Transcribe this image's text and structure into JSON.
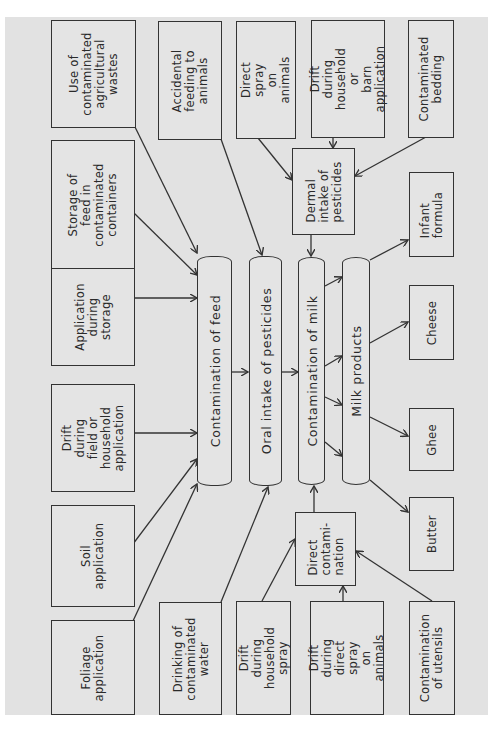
{
  "diagram": {
    "sources_feed": [
      {
        "id": "foliage",
        "label": "Foliage\napplication"
      },
      {
        "id": "soil",
        "label": "Soil\napplication"
      },
      {
        "id": "drift_field",
        "label": "Drift during\nfield or\nhousehold\napplication"
      },
      {
        "id": "app_storage",
        "label": "Application\nduring\nstorage"
      },
      {
        "id": "storage_containers",
        "label": "Storage of\nfeed in\ncontaminated\ncontainers"
      },
      {
        "id": "agri_wastes",
        "label": "Use of\ncontaminated\nagricultural\nwastes"
      }
    ],
    "sources_oral": [
      {
        "id": "drinking_water",
        "label": "Drinking of\ncontaminated\nwater"
      },
      {
        "id": "accidental_feeding",
        "label": "Accidental\nfeeding to\nanimals"
      }
    ],
    "sources_dermal": [
      {
        "id": "direct_spray",
        "label": "Direct\nspray on\nanimals"
      },
      {
        "id": "drift_barn",
        "label": "Drift during\nhousehold or\nbarn\napplication"
      },
      {
        "id": "bedding",
        "label": "Contaminated\nbedding"
      }
    ],
    "sources_direct": [
      {
        "id": "drift_household_spray",
        "label": "Drift during\nhousehold\nspray"
      },
      {
        "id": "drift_direct_spray",
        "label": "Drift during\ndirect spray\non animals"
      },
      {
        "id": "utensils",
        "label": "Contamination\nof utensils"
      }
    ],
    "process": {
      "contamination_feed": "Contamination of feed",
      "oral_intake": "Oral intake of pesticides",
      "contamination_milk": "Contamination of milk",
      "milk_products": "Milk products",
      "dermal_intake": "Dermal\nintake of\npesticides",
      "direct_contamination": "Direct\ncontami-\nnation"
    },
    "products": [
      {
        "id": "butter",
        "label": "Butter"
      },
      {
        "id": "ghee",
        "label": "Ghee"
      },
      {
        "id": "cheese",
        "label": "Cheese"
      },
      {
        "id": "infant_formula",
        "label": "Infant\nformula"
      }
    ]
  }
}
